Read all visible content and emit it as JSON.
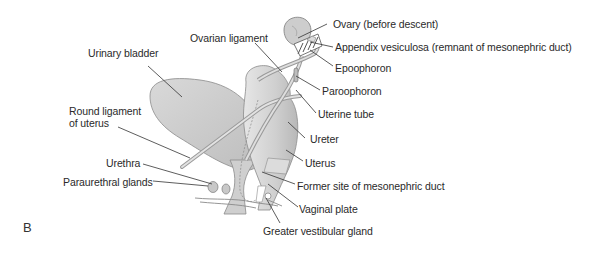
{
  "figure": {
    "panel_label": "B",
    "labels": {
      "ovary": "Ovary (before descent)",
      "appendix_vesiculosa": "Appendix vesiculosa (remnant of mesonephric duct)",
      "epoophoron": "Epoophoron",
      "paroophoron": "Paroophoron",
      "uterine_tube": "Uterine tube",
      "ureter": "Ureter",
      "uterus": "Uterus",
      "former_site": "Former site of mesonephric duct",
      "vaginal_plate": "Vaginal plate",
      "greater_vestibular_gland": "Greater vestibular gland",
      "ovarian_ligament": "Ovarian ligament",
      "urinary_bladder": "Urinary bladder",
      "round_ligament_1": "Round ligament",
      "round_ligament_2": "of uterus",
      "urethra": "Urethra",
      "paraurethral_glands": "Paraurethral glands"
    },
    "colors": {
      "organ_fill": "#cfcfcf",
      "organ_light": "#e4e4e4",
      "outline": "#7a7a7a",
      "leader": "#333333",
      "text": "#2a2a2a"
    }
  }
}
